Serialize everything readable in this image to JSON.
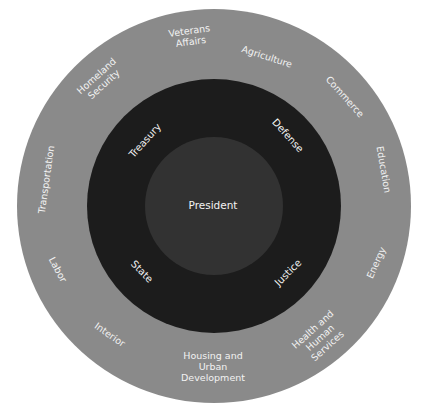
{
  "colors": {
    "outer_ring": "#8a8a8a",
    "middle_ring": "#1c1c1c",
    "inner_circle": "#323232",
    "text": "#f2f2f2",
    "background": "#ffffff"
  },
  "center": {
    "label": "President"
  },
  "inner_ring": [
    {
      "label": "Treasury"
    },
    {
      "label": "Defense"
    },
    {
      "label": "State"
    },
    {
      "label": "Justice"
    }
  ],
  "outer_ring": [
    {
      "label": "Veterans\nAffairs"
    },
    {
      "label": "Agriculture"
    },
    {
      "label": "Commerce"
    },
    {
      "label": "Education"
    },
    {
      "label": "Energy"
    },
    {
      "label": "Health and\nHuman\nServices"
    },
    {
      "label": "Housing and\nUrban\nDevelopment"
    },
    {
      "label": "Interior"
    },
    {
      "label": "Labor"
    },
    {
      "label": "Transportation"
    },
    {
      "label": "Homeland\nSecurity"
    }
  ]
}
